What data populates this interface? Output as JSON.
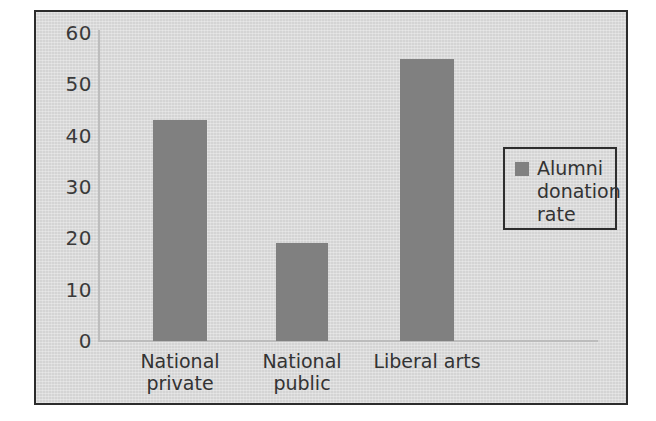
{
  "figure": {
    "background_color": "#d4d4d4",
    "frame_color": "#2c2c2c",
    "bar_color": "#808080",
    "text_color": "#333333"
  },
  "legend": {
    "position": "right",
    "entries": [
      {
        "label": "Alumni\ndonation\nrate",
        "color": "#808080"
      }
    ]
  },
  "chart_data": {
    "type": "bar",
    "title": "",
    "subtitle": "",
    "xlabel": "",
    "ylabel": "",
    "categories": [
      "National private",
      "National public",
      "Liberal arts"
    ],
    "category_lines": [
      [
        "National",
        "private"
      ],
      [
        "National",
        "public"
      ],
      [
        "Liberal arts"
      ]
    ],
    "series": [
      {
        "name": "Alumni donation rate",
        "color": "#808080",
        "values": [
          43,
          19,
          55
        ]
      }
    ],
    "values": [
      43,
      19,
      55
    ],
    "ylim": [
      0,
      60
    ],
    "ytick_values": [
      0,
      10,
      20,
      30,
      40,
      50,
      60
    ],
    "ytick_labels": [
      "0",
      "10",
      "20",
      "30",
      "40",
      "50",
      "60"
    ],
    "grid": false,
    "legend_position": "right",
    "annotations": []
  }
}
